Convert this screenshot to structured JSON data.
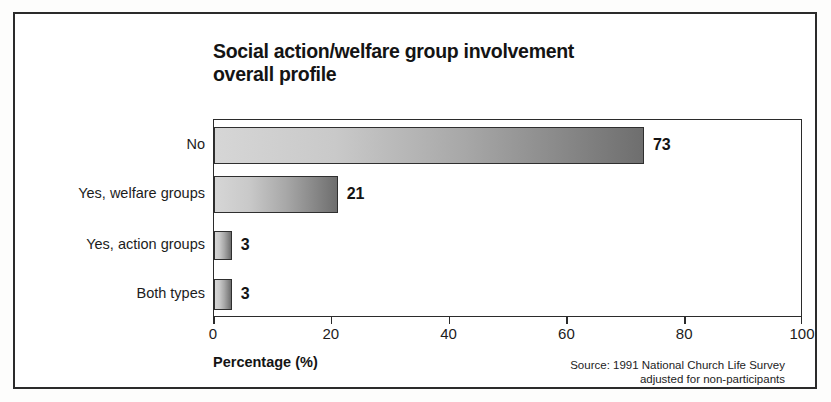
{
  "chart_data": {
    "type": "bar",
    "orientation": "horizontal",
    "title": "Social action/welfare group involvement\noverall profile",
    "categories": [
      "No",
      "Yes, welfare groups",
      "Yes, action groups",
      "Both types"
    ],
    "values": [
      73,
      21,
      3,
      3
    ],
    "value_labels": [
      "73",
      "21",
      "3",
      "3"
    ],
    "xlabel": "Percentage (%)",
    "ylabel": "",
    "xlim": [
      0,
      100
    ],
    "xticks": [
      0,
      20,
      40,
      60,
      80,
      100
    ],
    "xtick_labels": [
      "0",
      "20",
      "40",
      "60",
      "80",
      "100"
    ],
    "grid": false,
    "legend": null,
    "source_note": "Source: 1991 National Church Life Survey\nadjusted for non-participants",
    "colors": {
      "bar_gradient_start": "#d6d6d6",
      "bar_gradient_end": "#6e6e6e",
      "bar_border": "#2f2f2f",
      "axis": "#2b2b2b",
      "text": "#141414",
      "background": "#ffffff"
    }
  }
}
